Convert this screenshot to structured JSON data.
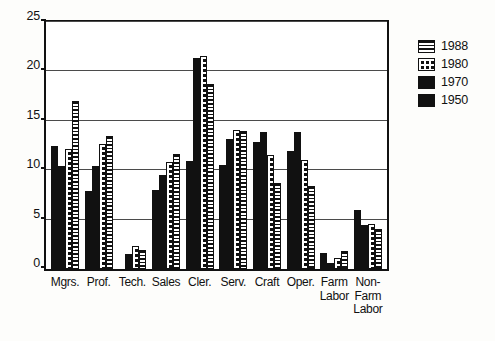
{
  "chart_data": {
    "type": "bar",
    "title": "",
    "xlabel": "",
    "ylabel": "",
    "ylim": [
      0,
      25
    ],
    "yticks": [
      0,
      5,
      10,
      15,
      20,
      25
    ],
    "grid": true,
    "legend_position": "right",
    "categories": [
      "Mgrs.",
      "Prof.",
      "Tech.",
      "Sales",
      "Cler.",
      "Serv.",
      "Craft",
      "Oper.",
      "Farm Labor",
      "Non-Farm Labor"
    ],
    "category_lines": [
      [
        "Mgrs."
      ],
      [
        "Prof."
      ],
      [
        "Tech."
      ],
      [
        "Sales"
      ],
      [
        "Cler."
      ],
      [
        "Serv."
      ],
      [
        "Craft"
      ],
      [
        "Oper."
      ],
      [
        "Farm",
        "Labor"
      ],
      [
        "Non-",
        "Farm",
        "Labor"
      ]
    ],
    "series": [
      {
        "name": "1950",
        "pattern": "solid-black",
        "values": [
          12.5,
          7.9,
          0.0,
          8.0,
          10.9,
          10.5,
          12.9,
          11.9,
          1.6,
          6.0
        ]
      },
      {
        "name": "1970",
        "pattern": "dense-speckle",
        "values": [
          10.4,
          10.4,
          1.5,
          9.5,
          21.4,
          13.2,
          13.9,
          13.9,
          0.6,
          4.5
        ]
      },
      {
        "name": "1980",
        "pattern": "sparse-dots",
        "values": [
          12.1,
          12.7,
          2.3,
          10.8,
          21.6,
          14.1,
          11.5,
          11.0,
          1.1,
          4.6
        ]
      },
      {
        "name": "1988",
        "pattern": "horizontal-lines",
        "values": [
          17.0,
          13.5,
          1.9,
          11.6,
          18.7,
          14.0,
          8.7,
          8.4,
          1.8,
          4.0
        ]
      }
    ],
    "series_draw_order": [
      "1950",
      "1970",
      "1980",
      "1988"
    ],
    "legend_entries": [
      "1988",
      "1980",
      "1970",
      "1950"
    ],
    "colors": {
      "axis": "#111111",
      "grid": "#4b4b4b",
      "plot_background": "#ffffff",
      "page_background": "#fdfdfb",
      "bar_ink": "#111111"
    }
  }
}
